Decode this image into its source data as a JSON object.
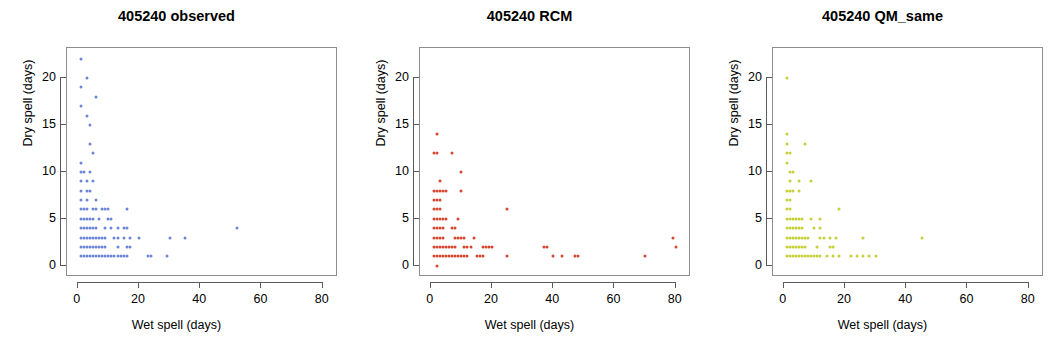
{
  "figure": {
    "background": "#ffffff",
    "panel_count": 3
  },
  "panels": [
    {
      "title": "405240 observed",
      "xlabel": "Wet spell (days)",
      "ylabel": "Dry spell (days)",
      "color": "#6b85d8"
    },
    {
      "title": "405240 RCM",
      "xlabel": "Wet spell (days)",
      "ylabel": "Dry spell (days)",
      "color": "#d6452e"
    },
    {
      "title": "405240 QM_same",
      "xlabel": "Wet spell (days)",
      "ylabel": "Dry spell (days)",
      "color": "#c5cf36"
    }
  ],
  "axes": {
    "x_ticks": [
      0,
      20,
      40,
      60,
      80
    ],
    "y_ticks": [
      0,
      5,
      10,
      15,
      20
    ],
    "xlim": [
      -3.5,
      85
    ],
    "ylim": [
      -1.2,
      23.2
    ]
  },
  "chart_data": [
    {
      "type": "scatter",
      "title": "405240 observed",
      "xlabel": "Wet spell (days)",
      "ylabel": "Dry spell (days)",
      "xlim": [
        -3.5,
        85
      ],
      "ylim": [
        -1.2,
        23.2
      ],
      "xticks": [
        0,
        20,
        40,
        60,
        80
      ],
      "yticks": [
        0,
        5,
        10,
        15,
        20
      ],
      "grid": false,
      "legend": null,
      "color": "#6b85d8",
      "points": [
        [
          1,
          22
        ],
        [
          3,
          20
        ],
        [
          1,
          19
        ],
        [
          6,
          18
        ],
        [
          1,
          17
        ],
        [
          3,
          16
        ],
        [
          4,
          15
        ],
        [
          4,
          13
        ],
        [
          5,
          12
        ],
        [
          1,
          11
        ],
        [
          1,
          10
        ],
        [
          2,
          10
        ],
        [
          4,
          10
        ],
        [
          1,
          9
        ],
        [
          3,
          9
        ],
        [
          5,
          9
        ],
        [
          1,
          8
        ],
        [
          3,
          8
        ],
        [
          4,
          8
        ],
        [
          1,
          7
        ],
        [
          3,
          7
        ],
        [
          6,
          7
        ],
        [
          1,
          6
        ],
        [
          2,
          6
        ],
        [
          3,
          6
        ],
        [
          5,
          6
        ],
        [
          6,
          6
        ],
        [
          8,
          6
        ],
        [
          9,
          6
        ],
        [
          10,
          6
        ],
        [
          16,
          6
        ],
        [
          1,
          5
        ],
        [
          2,
          5
        ],
        [
          3,
          5
        ],
        [
          4,
          5
        ],
        [
          5,
          5
        ],
        [
          7,
          5
        ],
        [
          10,
          5
        ],
        [
          11,
          5
        ],
        [
          1,
          4
        ],
        [
          2,
          4
        ],
        [
          3,
          4
        ],
        [
          4,
          4
        ],
        [
          5,
          4
        ],
        [
          6,
          4
        ],
        [
          9,
          4
        ],
        [
          11,
          4
        ],
        [
          13,
          4
        ],
        [
          15,
          4
        ],
        [
          16,
          4
        ],
        [
          52,
          4
        ],
        [
          1,
          3
        ],
        [
          2,
          3
        ],
        [
          3,
          3
        ],
        [
          4,
          3
        ],
        [
          5,
          3
        ],
        [
          6,
          3
        ],
        [
          7,
          3
        ],
        [
          8,
          3
        ],
        [
          9,
          3
        ],
        [
          12,
          3
        ],
        [
          13,
          3
        ],
        [
          15,
          3
        ],
        [
          17,
          3
        ],
        [
          20,
          3
        ],
        [
          30,
          3
        ],
        [
          35,
          3
        ],
        [
          1,
          2
        ],
        [
          2,
          2
        ],
        [
          3,
          2
        ],
        [
          4,
          2
        ],
        [
          5,
          2
        ],
        [
          6,
          2
        ],
        [
          7,
          2
        ],
        [
          8,
          2
        ],
        [
          9,
          2
        ],
        [
          13,
          2
        ],
        [
          16,
          2
        ],
        [
          17,
          2
        ],
        [
          1,
          1
        ],
        [
          2,
          1
        ],
        [
          3,
          1
        ],
        [
          4,
          1
        ],
        [
          5,
          1
        ],
        [
          6,
          1
        ],
        [
          7,
          1
        ],
        [
          8,
          1
        ],
        [
          9,
          1
        ],
        [
          10,
          1
        ],
        [
          11,
          1
        ],
        [
          12,
          1
        ],
        [
          13,
          1
        ],
        [
          14,
          1
        ],
        [
          15,
          1
        ],
        [
          16,
          1
        ],
        [
          23,
          1
        ],
        [
          24,
          1
        ],
        [
          29,
          1
        ]
      ]
    },
    {
      "type": "scatter",
      "title": "405240 RCM",
      "xlabel": "Wet spell (days)",
      "ylabel": "Dry spell (days)",
      "xlim": [
        -3.5,
        85
      ],
      "ylim": [
        -1.2,
        23.2
      ],
      "xticks": [
        0,
        20,
        40,
        60,
        80
      ],
      "yticks": [
        0,
        5,
        10,
        15,
        20
      ],
      "grid": false,
      "legend": null,
      "color": "#d6452e",
      "points": [
        [
          2,
          14
        ],
        [
          1,
          12
        ],
        [
          2,
          12
        ],
        [
          7,
          12
        ],
        [
          10,
          10
        ],
        [
          3,
          9
        ],
        [
          1,
          8
        ],
        [
          2,
          8
        ],
        [
          3,
          8
        ],
        [
          4,
          8
        ],
        [
          5,
          8
        ],
        [
          10,
          8
        ],
        [
          1,
          7
        ],
        [
          2,
          7
        ],
        [
          3,
          7
        ],
        [
          1,
          6
        ],
        [
          2,
          6
        ],
        [
          3,
          6
        ],
        [
          25,
          6
        ],
        [
          1,
          5
        ],
        [
          2,
          5
        ],
        [
          3,
          5
        ],
        [
          4,
          5
        ],
        [
          5,
          5
        ],
        [
          9,
          5
        ],
        [
          1,
          4
        ],
        [
          2,
          4
        ],
        [
          3,
          4
        ],
        [
          4,
          4
        ],
        [
          7,
          4
        ],
        [
          8,
          4
        ],
        [
          1,
          3
        ],
        [
          2,
          3
        ],
        [
          3,
          3
        ],
        [
          4,
          3
        ],
        [
          8,
          3
        ],
        [
          9,
          3
        ],
        [
          10,
          3
        ],
        [
          11,
          3
        ],
        [
          14,
          3
        ],
        [
          79,
          3
        ],
        [
          1,
          2
        ],
        [
          2,
          2
        ],
        [
          3,
          2
        ],
        [
          4,
          2
        ],
        [
          5,
          2
        ],
        [
          6,
          2
        ],
        [
          7,
          2
        ],
        [
          8,
          2
        ],
        [
          11,
          2
        ],
        [
          12,
          2
        ],
        [
          13,
          2
        ],
        [
          17,
          2
        ],
        [
          18,
          2
        ],
        [
          19,
          2
        ],
        [
          20,
          2
        ],
        [
          37,
          2
        ],
        [
          38,
          2
        ],
        [
          80,
          2
        ],
        [
          1,
          1
        ],
        [
          2,
          1
        ],
        [
          3,
          1
        ],
        [
          4,
          1
        ],
        [
          5,
          1
        ],
        [
          6,
          1
        ],
        [
          7,
          1
        ],
        [
          8,
          1
        ],
        [
          9,
          1
        ],
        [
          10,
          1
        ],
        [
          11,
          1
        ],
        [
          12,
          1
        ],
        [
          15,
          1
        ],
        [
          16,
          1
        ],
        [
          17,
          1
        ],
        [
          25,
          1
        ],
        [
          40,
          1
        ],
        [
          43,
          1
        ],
        [
          47,
          1
        ],
        [
          48,
          1
        ],
        [
          70,
          1
        ],
        [
          2,
          0
        ]
      ]
    },
    {
      "type": "scatter",
      "title": "405240 QM_same",
      "xlabel": "Wet spell (days)",
      "ylabel": "Dry spell (days)",
      "xlim": [
        -3.5,
        85
      ],
      "ylim": [
        -1.2,
        23.2
      ],
      "xticks": [
        0,
        20,
        40,
        60,
        80
      ],
      "yticks": [
        0,
        5,
        10,
        15,
        20
      ],
      "grid": false,
      "legend": null,
      "color": "#c5cf36",
      "points": [
        [
          1,
          20
        ],
        [
          1,
          14
        ],
        [
          1,
          13
        ],
        [
          7,
          13
        ],
        [
          1,
          12
        ],
        [
          2,
          12
        ],
        [
          1,
          11
        ],
        [
          2,
          10
        ],
        [
          3,
          10
        ],
        [
          2,
          9
        ],
        [
          5,
          9
        ],
        [
          9,
          9
        ],
        [
          1,
          8
        ],
        [
          2,
          8
        ],
        [
          3,
          8
        ],
        [
          5,
          8
        ],
        [
          1,
          7
        ],
        [
          2,
          7
        ],
        [
          1,
          6
        ],
        [
          2,
          6
        ],
        [
          18,
          6
        ],
        [
          1,
          5
        ],
        [
          2,
          5
        ],
        [
          3,
          5
        ],
        [
          4,
          5
        ],
        [
          5,
          5
        ],
        [
          6,
          5
        ],
        [
          9,
          5
        ],
        [
          12,
          5
        ],
        [
          1,
          4
        ],
        [
          2,
          4
        ],
        [
          3,
          4
        ],
        [
          4,
          4
        ],
        [
          5,
          4
        ],
        [
          6,
          4
        ],
        [
          10,
          4
        ],
        [
          12,
          4
        ],
        [
          1,
          3
        ],
        [
          2,
          3
        ],
        [
          3,
          3
        ],
        [
          4,
          3
        ],
        [
          5,
          3
        ],
        [
          6,
          3
        ],
        [
          7,
          3
        ],
        [
          8,
          3
        ],
        [
          12,
          3
        ],
        [
          13,
          3
        ],
        [
          15,
          3
        ],
        [
          17,
          3
        ],
        [
          26,
          3
        ],
        [
          45,
          3
        ],
        [
          1,
          2
        ],
        [
          2,
          2
        ],
        [
          3,
          2
        ],
        [
          4,
          2
        ],
        [
          5,
          2
        ],
        [
          6,
          2
        ],
        [
          7,
          2
        ],
        [
          11,
          2
        ],
        [
          15,
          2
        ],
        [
          16,
          2
        ],
        [
          1,
          1
        ],
        [
          2,
          1
        ],
        [
          3,
          1
        ],
        [
          4,
          1
        ],
        [
          5,
          1
        ],
        [
          6,
          1
        ],
        [
          7,
          1
        ],
        [
          8,
          1
        ],
        [
          9,
          1
        ],
        [
          10,
          1
        ],
        [
          11,
          1
        ],
        [
          12,
          1
        ],
        [
          14,
          1
        ],
        [
          16,
          1
        ],
        [
          18,
          1
        ],
        [
          22,
          1
        ],
        [
          24,
          1
        ],
        [
          26,
          1
        ],
        [
          28,
          1
        ],
        [
          30,
          1
        ]
      ]
    }
  ]
}
